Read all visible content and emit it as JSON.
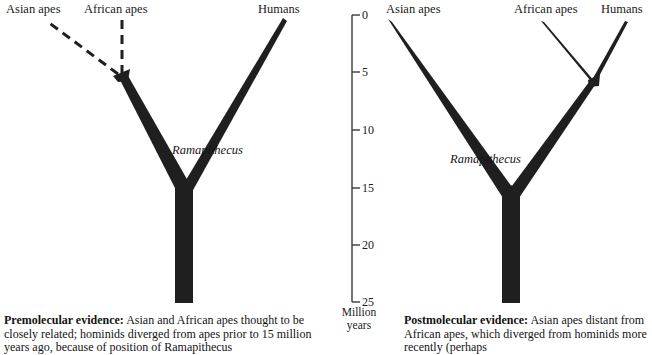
{
  "figure": {
    "background_color": "#ffffff",
    "line_color": "#1f1f1f"
  },
  "axis": {
    "name": "time-axis",
    "unit_label_line1": "Million",
    "unit_label_line2": "years",
    "min": 0,
    "max": 25,
    "direction": "top-is-present",
    "ticks": [
      {
        "value": "0",
        "y": 15
      },
      {
        "value": "5",
        "y": 72
      },
      {
        "value": "10",
        "y": 130
      },
      {
        "value": "15",
        "y": 188
      },
      {
        "value": "20",
        "y": 245
      },
      {
        "value": "25",
        "y": 302
      }
    ]
  },
  "left_tree": {
    "name": "premolecular-tree",
    "tips": [
      {
        "id": "asian-apes",
        "label": "Asian apes",
        "x": 6,
        "y": 4
      },
      {
        "id": "african-apes",
        "label": "African apes",
        "x": 84,
        "y": 4
      },
      {
        "id": "humans",
        "label": "Humans",
        "x": 258,
        "y": 4
      }
    ],
    "taxon": {
      "id": "ramapithecus",
      "label": "Ramapithecus",
      "x": 172,
      "y": 143
    },
    "nodes": {
      "ape_split_my": 5,
      "hominid_split_my": 15,
      "root_my": 25
    }
  },
  "right_tree": {
    "name": "postmolecular-tree",
    "tips": [
      {
        "id": "asian-apes",
        "label": "Asian apes",
        "x": 386,
        "y": 4
      },
      {
        "id": "african-apes",
        "label": "African apes",
        "x": 514,
        "y": 4
      },
      {
        "id": "humans",
        "label": "Humans",
        "x": 601,
        "y": 4
      }
    ],
    "taxon": {
      "id": "ramapithecus",
      "label": "Ramapithecus",
      "x": 450,
      "y": 152
    },
    "nodes": {
      "african_human_split_my": 5.5,
      "asian_split_my": 16,
      "root_my": 25
    }
  },
  "captions": {
    "left": {
      "lead": "Premolecular evidence:",
      "body": " Asian and African apes thought to be closely related; hominids diverged from apes prior to 15 million years ago, because of position of Ramapithecus"
    },
    "right": {
      "lead": "Postmolecular evidence:",
      "body": " Asian apes distant from African apes, which diverged from hominids more recently (perhaps"
    }
  }
}
